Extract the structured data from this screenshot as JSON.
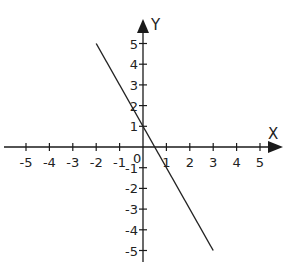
{
  "chart_data": {
    "type": "line",
    "title": "",
    "xlabel": "X",
    "ylabel": "Y",
    "xlim": [
      -5,
      5
    ],
    "ylim": [
      -5,
      5
    ],
    "grid": false,
    "origin_label": "0",
    "x_ticks": [
      -5,
      -4,
      -3,
      -2,
      -1,
      1,
      2,
      3,
      4,
      5
    ],
    "y_ticks": [
      5,
      4,
      3,
      2,
      1,
      -1,
      -2,
      -3,
      -4,
      -5
    ],
    "series": [
      {
        "name": "y = -2x + 1",
        "x": [
          -2,
          3
        ],
        "y": [
          5,
          -5
        ]
      }
    ]
  },
  "colors": {
    "axis": "#1a1a1a",
    "line": "#222222",
    "text": "#222222"
  }
}
